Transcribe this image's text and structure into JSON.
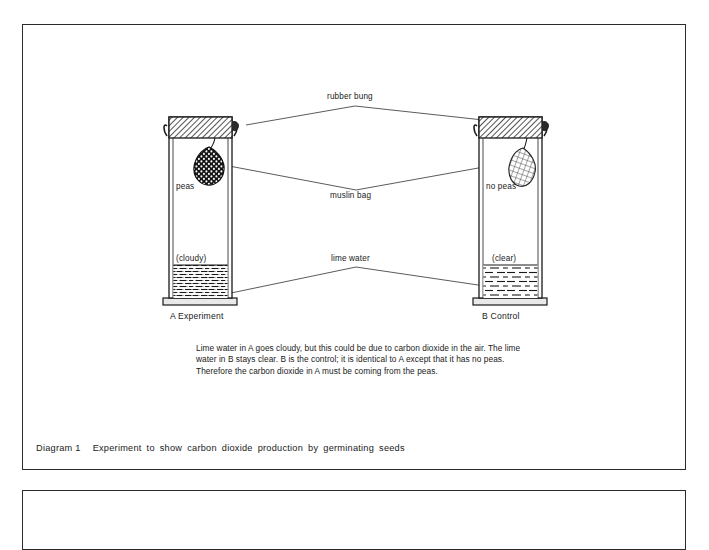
{
  "page": {
    "background_color": "#ffffff",
    "frame_border_color": "#2b2b2b"
  },
  "diagram": {
    "leader_labels": {
      "rubber_bung": "rubber bung",
      "muslin_bag": "muslin bag",
      "lime_water": "lime water"
    },
    "apparatus": [
      {
        "id": "A",
        "caption_letter": "A",
        "caption_name": "Experiment",
        "caption": "A   Experiment",
        "contents_label": "peas",
        "liquid_label": "(cloudy)",
        "bag_state": "filled-with-peas",
        "liquid_state": "cloudy"
      },
      {
        "id": "B",
        "caption_letter": "B",
        "caption_name": "Control",
        "caption": "B   Control",
        "contents_label": "no peas",
        "liquid_label": "(clear)",
        "bag_state": "empty",
        "liquid_state": "clear"
      }
    ]
  },
  "explanation": {
    "text": "Lime water in A goes cloudy, but this could be due to carbon dioxide in the air. The lime water in B stays clear. B is the control; it is identical to A except that it has no peas. Therefore the carbon dioxide in A must be coming from the peas."
  },
  "caption": {
    "number": "Diagram 1",
    "text": "Experiment to show carbon dioxide production by germinating seeds"
  }
}
